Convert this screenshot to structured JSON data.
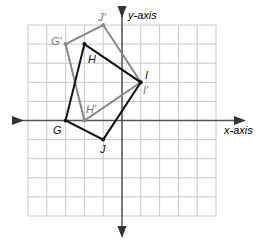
{
  "diagram": {
    "type": "coordinate-plane-transformation",
    "axes": {
      "x_label": "x-axis",
      "y_label": "y-axis"
    },
    "grid": {
      "columns": 10,
      "rows": 10,
      "x_range": [
        -5,
        5
      ],
      "y_range": [
        -5,
        5
      ]
    },
    "original_figure": {
      "color": "#111111",
      "vertices": [
        {
          "name": "G",
          "x": -3,
          "y": 0
        },
        {
          "name": "H",
          "x": -2,
          "y": 4
        },
        {
          "name": "I",
          "x": 1,
          "y": 2
        },
        {
          "name": "J",
          "x": -1,
          "y": -1
        }
      ]
    },
    "image_figure": {
      "color": "#888888",
      "vertices": [
        {
          "name": "G'",
          "x": -3,
          "y": 4
        },
        {
          "name": "J'",
          "x": -1,
          "y": 5
        },
        {
          "name": "I'",
          "x": 1,
          "y": 2
        },
        {
          "name": "H'",
          "x": -2,
          "y": 0
        }
      ]
    }
  }
}
